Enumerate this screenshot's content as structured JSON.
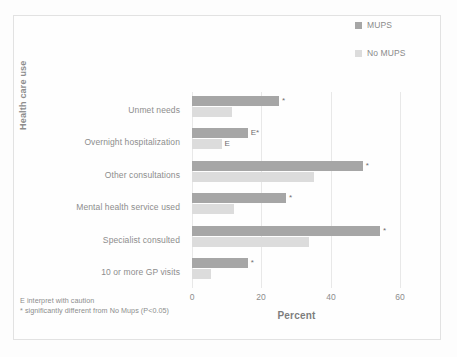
{
  "chart_data": {
    "type": "bar",
    "orientation": "horizontal",
    "title": "",
    "xlabel": "Percent",
    "ylabel": "Health care use",
    "xlim": [
      0,
      60
    ],
    "xticks": [
      "0",
      "20",
      "40",
      "60"
    ],
    "grid": "vertical",
    "legend_position": "top-right",
    "categories": [
      "Unmet needs",
      "Overnight hospitalization",
      "Other consultations",
      "Mental health service used",
      "Specialist consulted",
      "10 or more GP visits"
    ],
    "series": [
      {
        "name": "MUPS",
        "color": "#a6a6a6",
        "values": [
          25,
          16,
          49,
          27,
          54,
          16
        ],
        "annotations": [
          "*",
          "E*",
          "*",
          "*",
          "*",
          "*"
        ]
      },
      {
        "name": "No MUPS",
        "color": "#dcdcdc",
        "values": [
          11.5,
          8.5,
          35,
          12,
          33.5,
          5.5
        ],
        "annotations": [
          "",
          "E",
          "",
          "",
          "",
          ""
        ]
      }
    ]
  },
  "legend": {
    "items": [
      {
        "label": "MUPS",
        "color": "#a6a6a6"
      },
      {
        "label": "No MUPS",
        "color": "#dcdcdc"
      }
    ]
  },
  "axes": {
    "x_title": "Percent",
    "y_title": "Health care use",
    "x_ticks": [
      "0",
      "20",
      "40",
      "60"
    ]
  },
  "footnotes": [
    "E  interpret with caution",
    "*  significantly different from No Mups (P<0.05)"
  ]
}
